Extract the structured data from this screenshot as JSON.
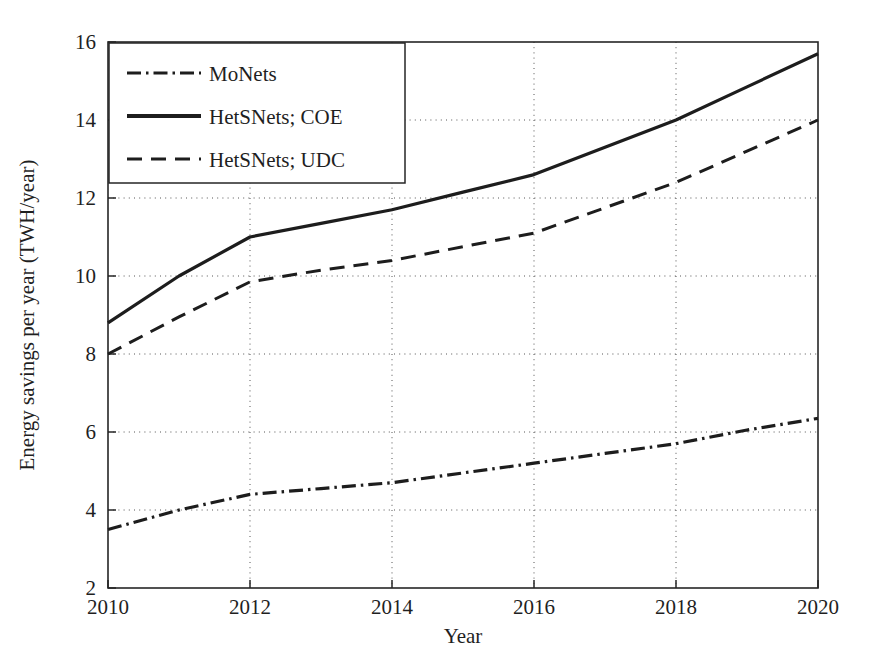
{
  "chart_data": {
    "type": "line",
    "title": "",
    "subtitle": "",
    "xlabel": "Year",
    "ylabel": "Energy savings per year (TWH/year)",
    "xlim": [
      2010,
      2020
    ],
    "ylim": [
      2,
      16
    ],
    "xticks": [
      2010,
      2012,
      2014,
      2016,
      2018,
      2020
    ],
    "xticklabels": [
      "2010",
      "2012",
      "2014",
      "2016",
      "2018",
      "2020"
    ],
    "yticks": [
      2,
      4,
      6,
      8,
      10,
      12,
      14,
      16
    ],
    "yticklabels": [
      "2",
      "4",
      "6",
      "8",
      "10",
      "12",
      "14",
      "16"
    ],
    "grid": true,
    "grid_style": "dotted",
    "legend_position": "upper left",
    "x": [
      2010,
      2011,
      2012,
      2013,
      2014,
      2015,
      2016,
      2017,
      2018,
      2019,
      2020
    ],
    "series": [
      {
        "name": "MoNets",
        "style": "dash-dot",
        "color": "#1d1d1d",
        "values": [
          3.5,
          4.0,
          4.4,
          4.55,
          4.7,
          4.95,
          5.2,
          5.45,
          5.7,
          6.05,
          6.35
        ]
      },
      {
        "name": "HetSNets; COE",
        "style": "solid",
        "color": "#1d1d1d",
        "values": [
          8.8,
          10.0,
          11.0,
          11.35,
          11.7,
          12.15,
          12.6,
          13.3,
          14.0,
          14.85,
          15.7
        ]
      },
      {
        "name": "HetSNets; UDC",
        "style": "dashed",
        "color": "#1d1d1d",
        "values": [
          8.0,
          8.95,
          9.85,
          10.15,
          10.4,
          10.75,
          11.1,
          11.75,
          12.4,
          13.2,
          14.0
        ]
      }
    ]
  },
  "axes": {
    "x_title": "Year",
    "y_title": "Energy savings per year (TWH/year)"
  },
  "legend": {
    "entries": [
      {
        "label": "MoNets",
        "style": "dash-dot"
      },
      {
        "label": "HetSNets; COE",
        "style": "solid"
      },
      {
        "label": "HetSNets; UDC",
        "style": "dashed"
      }
    ]
  },
  "colors": {
    "foreground": "#1d1d1d",
    "background": "#ffffff",
    "grid": "#555555"
  }
}
